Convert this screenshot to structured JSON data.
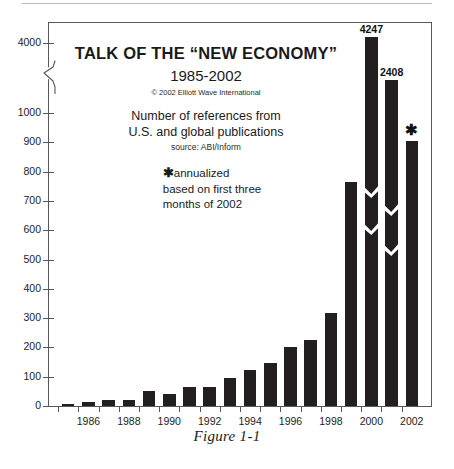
{
  "figure": {
    "caption": "Figure 1-1"
  },
  "inset": {
    "title": "TALK OF THE “NEW ECONOMY”",
    "subtitle": "1985-2002",
    "copyright": "© 2002 Elliott Wave International",
    "description_line1": "Number of references from",
    "description_line2": "U.S. and global publications",
    "source": "source: ABI/Inform",
    "note_star": "✱",
    "note_line1": "annualized",
    "note_line2": "based on first three",
    "note_line3": "months of 2002"
  },
  "chart_data": {
    "type": "bar",
    "title": "TALK OF THE “NEW ECONOMY” 1985-2002",
    "subtitle": "Number of references from U.S. and global publications",
    "xlabel": "",
    "ylabel": "",
    "ylim": [
      0,
      4400
    ],
    "grid": false,
    "legend": "none",
    "axis_break": {
      "present": true,
      "below": 1000,
      "above": 4000,
      "note": "y-axis is broken between 1000 and 4000; bars exceeding 1000 are drawn with zigzag break marks"
    },
    "ytick_labels": [
      "0",
      "100",
      "200",
      "300",
      "400",
      "500",
      "600",
      "700",
      "800",
      "900",
      "1000",
      "4000"
    ],
    "ytick_values": [
      0,
      100,
      200,
      300,
      400,
      500,
      600,
      700,
      800,
      900,
      1000,
      4000
    ],
    "xtick_labels": [
      "1986",
      "1988",
      "1990",
      "1992",
      "1994",
      "1996",
      "1998",
      "2000",
      "2002"
    ],
    "categories": [
      "1985",
      "1986",
      "1987",
      "1988",
      "1989",
      "1990",
      "1991",
      "1992",
      "1993",
      "1994",
      "1995",
      "1996",
      "1997",
      "1998",
      "1999",
      "2000",
      "2001",
      "2002"
    ],
    "values": [
      8,
      12,
      19,
      21,
      52,
      42,
      64,
      64,
      95,
      124,
      148,
      203,
      225,
      318,
      764,
      4247,
      2408,
      905
    ],
    "data_labels": {
      "2000": "4247",
      "2001": "2408",
      "2002": "✱"
    },
    "annotations": [
      {
        "label": "4247",
        "category": "2000"
      },
      {
        "label": "2408",
        "category": "2001"
      },
      {
        "label": "✱",
        "category": "2002",
        "meaning": "annualized based on first three months of 2002"
      }
    ]
  },
  "colors": {
    "bar": "#231f20",
    "axis": "#58585a",
    "background": "#ffffff",
    "text": "#1a1a1a"
  }
}
